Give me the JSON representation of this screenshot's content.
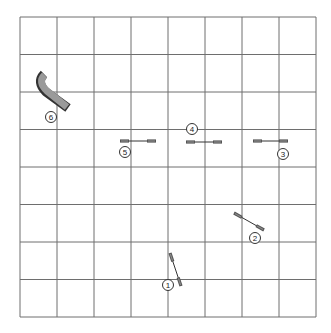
{
  "diagram": {
    "type": "agility-course-map",
    "grid": {
      "columns": 8,
      "rows": 8,
      "x0": 20,
      "y0": 17,
      "x1": 316,
      "y1": 317
    },
    "obstacles": [
      {
        "number": "1",
        "kind": "jump",
        "x1": 170,
        "y1": 253,
        "x2": 181,
        "y2": 286,
        "label_x": 168,
        "label_y": 285
      },
      {
        "number": "2",
        "kind": "jump",
        "x1": 234,
        "y1": 213,
        "x2": 264,
        "y2": 230,
        "label_x": 255,
        "label_y": 238
      },
      {
        "number": "3",
        "kind": "jump",
        "x1": 253,
        "y1": 141,
        "x2": 288,
        "y2": 141,
        "label_x": 283,
        "label_y": 154
      },
      {
        "number": "4",
        "kind": "jump",
        "x1": 186,
        "y1": 142,
        "x2": 222,
        "y2": 142,
        "label_x": 192,
        "label_y": 129
      },
      {
        "number": "5",
        "kind": "jump",
        "x1": 120,
        "y1": 141,
        "x2": 156,
        "y2": 141,
        "label_x": 125,
        "label_y": 152
      },
      {
        "number": "6",
        "kind": "tunnel",
        "label_x": 51,
        "label_y": 117
      }
    ]
  }
}
